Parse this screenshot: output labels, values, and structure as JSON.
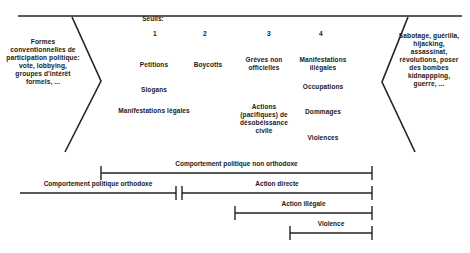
{
  "diagram": {
    "thresholds_header": "Seuils:",
    "threshold_numbers": [
      "1",
      "2",
      "3",
      "4"
    ],
    "left_panel": "Formes conventionnelles de participation politique: vote, lobbying, groupes d'intérêt formels, ...",
    "right_panel": "Sabotage, guérilla, hijacking, assassinat, révolutions, poser des bombes kidnappping, guerre, ...",
    "columns": [
      {
        "items": [
          "Petitions",
          "Slogans",
          "Manifestations légales"
        ]
      },
      {
        "items": [
          "Boycotts"
        ]
      },
      {
        "items": [
          "Grèves non officielles",
          "Actions (pacifiques) de désobéissance civile"
        ]
      },
      {
        "items": [
          "Manifestations illégales",
          "Occupations",
          "Dommages",
          "Violences"
        ]
      }
    ],
    "spans": [
      {
        "label": "Comportement politique non orthodoxe"
      },
      {
        "label": "Comportement politique orthodoxe"
      },
      {
        "label": "Action directe"
      },
      {
        "label": "Action illégale"
      },
      {
        "label": "Violence"
      }
    ],
    "line_color": "#222222",
    "text_color": "#1a1a1a",
    "background_color": "#ffffff"
  }
}
